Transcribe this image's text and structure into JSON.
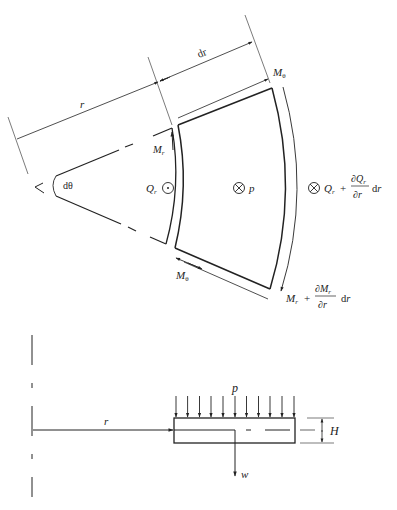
{
  "figure": {
    "top_view": {
      "description": "Plate element in polar coordinates with moments and shears",
      "labels": {
        "r": "r",
        "dr": "dr",
        "dtheta": "dθ",
        "M_theta_top": "Mθ",
        "M_theta_bottom": "Mθ",
        "M_r": "Mr",
        "Q_r": "Qr",
        "p": "p",
        "Q_r_plus": "Qr + ∂Qr/∂r dr",
        "M_r_plus": "Mr + ∂Mr/∂r dr"
      },
      "symbols": {
        "out_of_page": "⊙",
        "into_page": "⊗"
      }
    },
    "side_view": {
      "description": "Cross-section of plate with distributed load and deflection",
      "labels": {
        "p": "p",
        "r": "r",
        "H": "H",
        "w": "w"
      },
      "load_arrow_count": 11
    }
  },
  "colors": {
    "ink": "#222222",
    "background": "#ffffff"
  }
}
